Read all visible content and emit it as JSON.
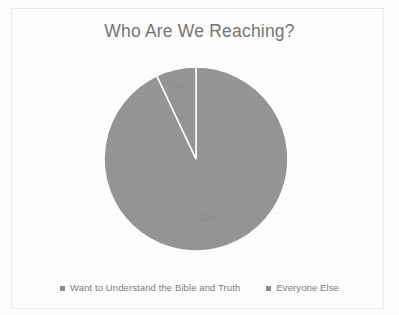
{
  "chart_data": {
    "type": "pie",
    "title": "Who Are We Reaching?",
    "xlabel": "",
    "ylabel": "",
    "categories": [
      "Want to Understand the Bible and Truth",
      "Everyone Else"
    ],
    "values": [
      93,
      7
    ],
    "value_labels": [
      "93%",
      "7%"
    ],
    "unit": "percent",
    "grid": false,
    "legend_position": "bottom",
    "start_angle_deg": 0,
    "direction": "clockwise",
    "slice_colors": [
      "#969696",
      "#969696"
    ],
    "slice_separator_color": "#ffffff",
    "series": [
      {
        "name": "Share of audience",
        "values": [
          93,
          7
        ]
      }
    ],
    "slices": [
      {
        "label": "Want to Understand the Bible and Truth",
        "value": 93,
        "value_label": "93%",
        "color": "#969696"
      },
      {
        "label": "Everyone Else",
        "value": 7,
        "value_label": "7%",
        "color": "#969696"
      }
    ]
  },
  "chart": {
    "title": "Who Are We Reaching?",
    "title_color": "#767676",
    "plot_background": "#ffffff",
    "border_color": "#ececec"
  },
  "legend": {
    "items": [
      {
        "label": "Want to Understand the Bible and Truth",
        "swatch_icon": "legend-square-icon",
        "color": "#8f8f8f"
      },
      {
        "label": "Everyone Else",
        "swatch_icon": "legend-square-icon",
        "color": "#8f8f8f"
      }
    ]
  }
}
